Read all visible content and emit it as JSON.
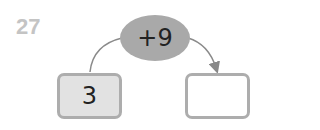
{
  "problem": {
    "number": "27",
    "operation": "+9",
    "start_value": "3",
    "answer_value": ""
  },
  "colors": {
    "number_label": "#c4c4c4",
    "operation_fill": "#a9a9a9",
    "box_border": "#adadad",
    "start_fill": "#e2e2e2",
    "arrow": "#888888"
  }
}
